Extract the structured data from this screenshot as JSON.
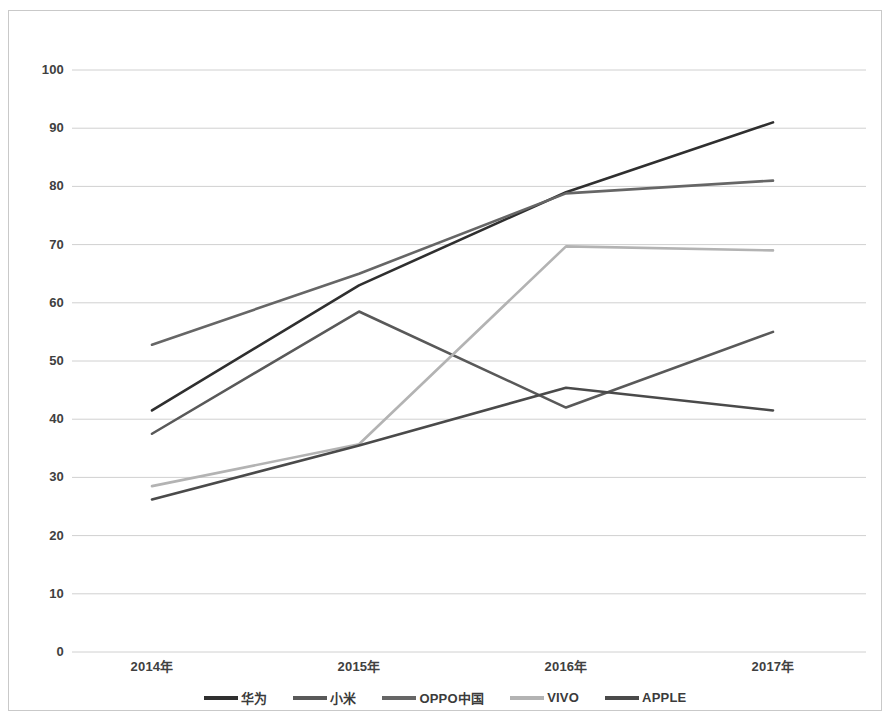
{
  "chart_data": {
    "type": "line",
    "title": "",
    "xlabel": "",
    "ylabel": "",
    "categories": [
      "2014年",
      "2015年",
      "2016年",
      "2017年"
    ],
    "ylim": [
      0,
      100
    ],
    "yticks": [
      0,
      10,
      20,
      30,
      40,
      50,
      60,
      70,
      80,
      90,
      100
    ],
    "grid": true,
    "legend_position": "bottom",
    "series": [
      {
        "name": "华为",
        "values": [
          41.5,
          63.0,
          79.0,
          91.0
        ],
        "color": "#2f2f2f"
      },
      {
        "name": "小米",
        "values": [
          37.5,
          58.5,
          42.0,
          55.0
        ],
        "color": "#595959"
      },
      {
        "name": "OPPO中国",
        "values": [
          52.8,
          65.0,
          78.8,
          81.0
        ],
        "color": "#666666"
      },
      {
        "name": "VIVO",
        "values": [
          28.5,
          35.7,
          69.7,
          69.0
        ],
        "color": "#b3b3b3"
      },
      {
        "name": "APPLE",
        "values": [
          26.2,
          35.5,
          45.4,
          41.5
        ],
        "color": "#4a4a4a"
      }
    ]
  },
  "axis": {
    "y_tick_labels": [
      "100",
      "90",
      "80",
      "70",
      "60",
      "50",
      "40",
      "30",
      "20",
      "10",
      "0"
    ],
    "x_tick_labels": [
      "2014年",
      "2015年",
      "2016年",
      "2017年"
    ]
  },
  "legend": {
    "items": [
      {
        "label": "华为",
        "color": "#2f2f2f"
      },
      {
        "label": "小米",
        "color": "#595959"
      },
      {
        "label": "OPPO中国",
        "color": "#666666"
      },
      {
        "label": "VIVO",
        "color": "#b3b3b3"
      },
      {
        "label": "APPLE",
        "color": "#4a4a4a"
      }
    ]
  },
  "colors": {
    "background": "#ffffff",
    "gridline": "#d0d0d0",
    "border": "#c9c9c9",
    "text": "#3a3a3a"
  }
}
